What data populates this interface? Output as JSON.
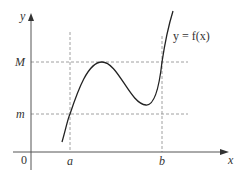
{
  "diagram": {
    "function_label": "y = f(x)",
    "axes": {
      "x_label": "x",
      "y_label": "y",
      "origin_label": "0"
    },
    "x_markers": [
      {
        "label": "a"
      },
      {
        "label": "b"
      }
    ],
    "y_markers": [
      {
        "label": "M"
      },
      {
        "label": "m"
      }
    ],
    "colors": {
      "curve": "#222222",
      "axis": "#555555",
      "guide": "#888888",
      "text": "#333333",
      "background": "#ffffff"
    }
  }
}
